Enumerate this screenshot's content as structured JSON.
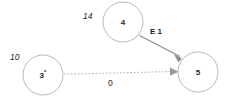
{
  "diagram": {
    "type": "directed-graph",
    "background_color": "#ffffff",
    "node_stroke_color": "#b8b8b8",
    "node_fill_color": "#ffffff",
    "edge_solid_color": "#8a8a8a",
    "edge_dashed_color": "#b0b0b0",
    "text_color": "#1c1c1c",
    "nodes": [
      {
        "id": "node-4",
        "label": "4",
        "suffix": "",
        "distance_label": "14",
        "cx": 123,
        "cy": 22,
        "r": 20
      },
      {
        "id": "node-3",
        "label": "3",
        "suffix": "*",
        "distance_label": "10",
        "cx": 43,
        "cy": 75,
        "r": 20
      },
      {
        "id": "node-5",
        "label": "5",
        "suffix": "",
        "distance_label": "",
        "cx": 198,
        "cy": 72,
        "r": 20
      }
    ],
    "edges": [
      {
        "id": "edge-4-to-5",
        "from": "node-4",
        "to": "node-5",
        "label": "E 1",
        "style": "solid",
        "label_style": "bold"
      },
      {
        "id": "edge-3-to-5",
        "from": "node-3",
        "to": "node-5",
        "label": "0",
        "style": "dashed",
        "label_style": "plain"
      }
    ]
  }
}
